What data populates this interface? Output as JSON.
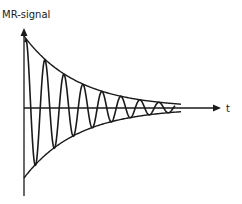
{
  "diagram": {
    "y_axis_label": "MR-signal",
    "x_axis_label": "t",
    "colors": {
      "ink": "#1a1a1a",
      "background": "#ffffff"
    },
    "geometry": {
      "origin_x": 24,
      "axis_y": 108,
      "y_axis_top": 28,
      "y_axis_bottom": 196,
      "x_axis_end": 221,
      "amplitude_upper": 72,
      "amplitude_lower": 70,
      "decay_rate": 0.0187,
      "period": 19,
      "signal_end_x": 175
    },
    "elements": [
      {
        "name": "y-axis",
        "description": "vertical axis with arrow, labeled MR-signal"
      },
      {
        "name": "x-axis",
        "description": "horizontal time axis with arrow, labeled t"
      },
      {
        "name": "upper-envelope",
        "description": "exponential decay curve bounding peaks"
      },
      {
        "name": "lower-envelope",
        "description": "mirrored exponential decay bounding troughs"
      },
      {
        "name": "damped-oscillation",
        "description": "decaying cosine signal"
      }
    ]
  }
}
